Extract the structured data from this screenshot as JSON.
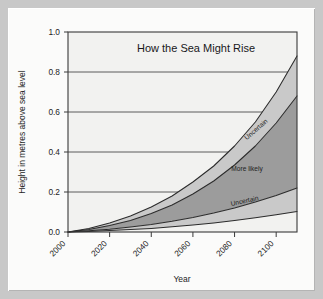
{
  "figure": {
    "frame_color": "#c8c8c8",
    "panel_color": "#fbfbfa"
  },
  "chart_data": {
    "type": "area",
    "title": "How the Sea Might Rise",
    "xlabel": "Year",
    "ylabel": "Height in metres above sea level",
    "xlim": [
      2000,
      2110
    ],
    "ylim": [
      0.0,
      1.0
    ],
    "grid": true,
    "legend_position": "inline-annotations",
    "x_ticks": [
      2000,
      2020,
      2040,
      2060,
      2080,
      2100
    ],
    "x_tick_labels": [
      "2000",
      "2020",
      "2040",
      "2060",
      "2080",
      "2100"
    ],
    "y_ticks": [
      0.0,
      0.2,
      0.4,
      0.6,
      0.8,
      1.0
    ],
    "y_tick_labels": [
      "0.0",
      "0.2",
      "0.4",
      "0.6",
      "0.8",
      "1.0"
    ],
    "x": [
      2000,
      2010,
      2020,
      2030,
      2040,
      2050,
      2060,
      2070,
      2080,
      2090,
      2100,
      2110
    ],
    "series": [
      {
        "name": "Upper uncertain bound",
        "values": [
          0.0,
          0.018,
          0.045,
          0.08,
          0.125,
          0.18,
          0.25,
          0.33,
          0.43,
          0.55,
          0.7,
          0.88
        ]
      },
      {
        "name": "Upper more-likely bound",
        "values": [
          0.0,
          0.013,
          0.032,
          0.058,
          0.092,
          0.135,
          0.19,
          0.255,
          0.335,
          0.43,
          0.545,
          0.68
        ]
      },
      {
        "name": "Lower more-likely bound",
        "values": [
          0.0,
          0.006,
          0.014,
          0.025,
          0.038,
          0.054,
          0.073,
          0.095,
          0.12,
          0.15,
          0.183,
          0.22
        ]
      },
      {
        "name": "Lower uncertain bound",
        "values": [
          0.0,
          0.003,
          0.007,
          0.012,
          0.018,
          0.026,
          0.035,
          0.045,
          0.057,
          0.071,
          0.086,
          0.102
        ]
      }
    ],
    "bands": [
      {
        "name": "upper-uncertain-band",
        "label": "Uncertain",
        "color": "#c9c9c9",
        "upper": "Upper uncertain bound",
        "lower": "Upper more-likely bound"
      },
      {
        "name": "more-likely-band",
        "label": "More likely",
        "color": "#9c9c9c",
        "upper": "Upper more-likely bound",
        "lower": "Lower more-likely bound"
      },
      {
        "name": "lower-uncertain-band",
        "label": "Uncertain",
        "color": "#c9c9c9",
        "upper": "Lower more-likely bound",
        "lower": "Lower uncertain bound"
      }
    ],
    "annotations": [
      {
        "text": "Uncertain",
        "x": 2091,
        "y": 0.505,
        "rotation": -41
      },
      {
        "text": "More likely",
        "x": 2086,
        "y": 0.305,
        "rotation": 0
      },
      {
        "text": "Uncertain",
        "x": 2085,
        "y": 0.145,
        "rotation": -12
      }
    ]
  }
}
